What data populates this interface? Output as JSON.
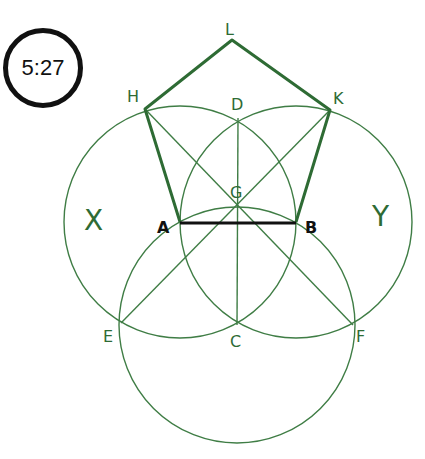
{
  "badge": {
    "text": "5:27"
  },
  "colors": {
    "construction": "#2e6b34",
    "segment": "#111111"
  },
  "points": {
    "L": "L",
    "H": "H",
    "K": "K",
    "D": "D",
    "G": "G",
    "A": "A",
    "B": "B",
    "E": "E",
    "C": "C",
    "F": "F"
  },
  "circles": {
    "X": "X",
    "Y": "Y"
  },
  "figure": {
    "shape": "regular pentagon A-H-L-K-B constructed on base AB",
    "circles": [
      "circle X centred A radius AB",
      "circle Y centred B radius AB",
      "circle centred C radius AB"
    ],
    "lines": [
      "HF",
      "KE",
      "DC",
      "AB"
    ]
  }
}
